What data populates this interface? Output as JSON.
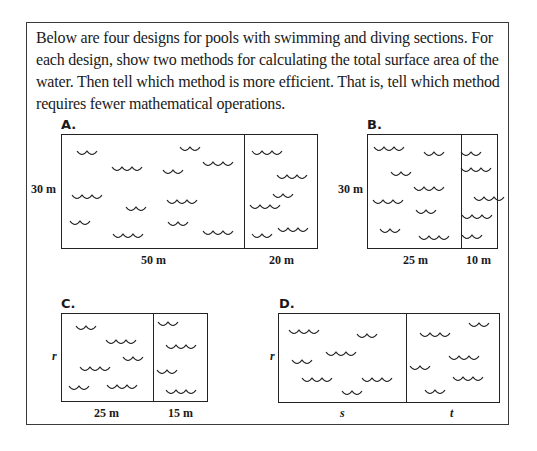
{
  "prompt": {
    "text": "Below are four designs for pools with swimming and diving sections. For each design, show two methods for calculating the total surface area of the water. Then tell which method is more efficient. That is, tell which method requires fewer mathematical operations."
  },
  "designs": [
    {
      "id": "A",
      "label": "A.",
      "height_label": "30 m",
      "swim_width_label": "50 m",
      "dive_width_label": "20 m"
    },
    {
      "id": "B",
      "label": "B.",
      "height_label": "30 m",
      "swim_width_label": "25 m",
      "dive_width_label": "10 m"
    },
    {
      "id": "C",
      "label": "C.",
      "height_label": "r",
      "swim_width_label": "25 m",
      "dive_width_label": "15 m"
    },
    {
      "id": "D",
      "label": "D.",
      "height_label": "r",
      "swim_width_label": "s",
      "dive_width_label": "t"
    }
  ],
  "icons": {
    "water": "wave-icon"
  }
}
